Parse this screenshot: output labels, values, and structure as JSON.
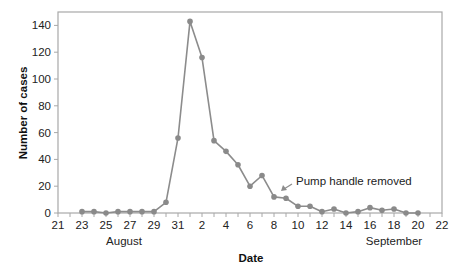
{
  "chart_data": {
    "type": "line",
    "title": "",
    "xlabel": "Date",
    "ylabel": "Number of cases",
    "ylim": [
      0,
      150
    ],
    "yticks": [
      0,
      20,
      40,
      60,
      80,
      100,
      120,
      140
    ],
    "xtick_labels": [
      "21",
      "23",
      "25",
      "27",
      "29",
      "31",
      "2",
      "4",
      "6",
      "8",
      "10",
      "12",
      "14",
      "16",
      "18",
      "20",
      "22"
    ],
    "x_range_days": [
      0,
      32
    ],
    "month_labels": [
      {
        "label": "August",
        "day_index": 5.5
      },
      {
        "label": "September",
        "day_index": 28
      }
    ],
    "grid": false,
    "legend": null,
    "categories": [
      "Aug 23",
      "Aug 24",
      "Aug 25",
      "Aug 26",
      "Aug 27",
      "Aug 28",
      "Aug 29",
      "Aug 30",
      "Aug 31",
      "Sep 1",
      "Sep 2",
      "Sep 3",
      "Sep 4",
      "Sep 5",
      "Sep 6",
      "Sep 7",
      "Sep 8",
      "Sep 9",
      "Sep 10",
      "Sep 11",
      "Sep 12",
      "Sep 13",
      "Sep 14",
      "Sep 15",
      "Sep 16",
      "Sep 17",
      "Sep 18",
      "Sep 19",
      "Sep 20"
    ],
    "day_index": [
      2,
      3,
      4,
      5,
      6,
      7,
      8,
      9,
      10,
      11,
      12,
      13,
      14,
      15,
      16,
      17,
      18,
      19,
      20,
      21,
      22,
      23,
      24,
      25,
      26,
      27,
      28,
      29,
      30
    ],
    "series": [
      {
        "name": "Number of cases",
        "values": [
          1,
          1,
          0,
          1,
          1,
          1,
          1,
          8,
          56,
          143,
          116,
          54,
          46,
          36,
          20,
          28,
          12,
          11,
          5,
          5,
          1,
          3,
          0,
          1,
          4,
          2,
          3,
          0,
          0
        ]
      }
    ],
    "annotations": [
      {
        "text": "Pump handle removed",
        "points_to": "Sep 8"
      }
    ],
    "colors": {
      "line": "#8c8c8c",
      "marker": "#8a8a8a",
      "axis": "#a8a8a8",
      "text": "#222222"
    }
  }
}
